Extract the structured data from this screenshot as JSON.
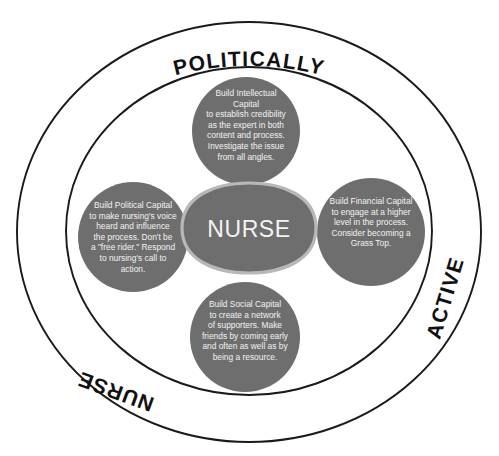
{
  "diagram": {
    "title": "Politically Active Nurse",
    "center": {
      "label": "NURSE"
    },
    "ring_labels": {
      "top": "POLITICALLY",
      "right": "ACTIVE",
      "bottom_left": "NURSE"
    },
    "lobes": [
      {
        "id": "intellectual-capital",
        "position": "top",
        "heading": "Build Intellectual Capital",
        "body": "to establish credibility as the expert in both content and process. Investigate the issue from all angles.",
        "lines": [
          "Build Intellectual",
          "Capital",
          "to establish credibility",
          "as the expert in both",
          "content and process.",
          "Investigate the issue",
          "from all angles."
        ]
      },
      {
        "id": "political-capital",
        "position": "left",
        "heading": "Build Political Capital",
        "body": "to make nursing's voice heard and influence the process. Don't be a \"free rider.\" Respond to nursing's call to action.",
        "lines": [
          "Build Political Capital",
          "to make nursing's voice",
          "heard and influence",
          "the process. Don't be",
          "a \"free rider.\" Respond",
          "to nursing's call to",
          "action."
        ]
      },
      {
        "id": "financial-capital",
        "position": "right",
        "heading": "Build Financial Capital",
        "body": "to engage at a higher level in the process. Consider becoming a Grass Top.",
        "lines": [
          "Build Financial Capital",
          "to engage at a higher",
          "level in the process.",
          "Consider becoming a",
          "Grass Top."
        ]
      },
      {
        "id": "social-capital",
        "position": "bottom",
        "heading": "Build Social Capital",
        "body": "to create a network of supporters. Make friends by coming early and often as well as by being a resource.",
        "lines": [
          "Build Social Capital",
          "to create a network",
          "of supporters. Make",
          "friends by coming early",
          "and often as well as by",
          "being a resource."
        ]
      }
    ],
    "colors": {
      "lobe_fill": "#6e6e6e",
      "lobe_overlap": "#4a4a4a",
      "center_fill": "#6e6e6e",
      "center_stroke": "#b8b8b8",
      "ring_stroke": "#1a1a1a",
      "text_on_fill": "#f2f2f2",
      "background": "#ffffff"
    }
  }
}
